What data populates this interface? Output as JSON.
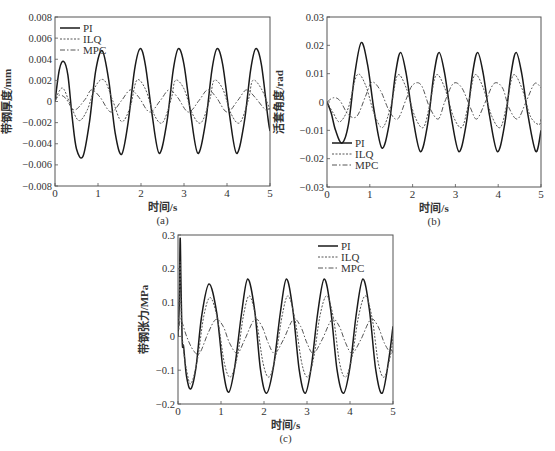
{
  "chart_data": [
    {
      "id": "a",
      "type": "line",
      "caption": "(a)",
      "xlabel": "时间/s",
      "ylabel": "带钢厚度/mm",
      "xlim": [
        0,
        5
      ],
      "ylim": [
        -0.008,
        0.008
      ],
      "xticks": [
        0,
        1,
        2,
        3,
        4,
        5
      ],
      "xtick_labels": [
        "0",
        "1",
        "2",
        "3",
        "4",
        "5"
      ],
      "yticks": [
        -0.008,
        -0.006,
        -0.004,
        -0.002,
        0,
        0.002,
        0.004,
        0.006,
        0.008
      ],
      "ytick_labels": [
        "-0.008",
        "-0.006",
        "-0.004",
        "-0.002",
        "0",
        "0.002",
        "0.004",
        "0.006",
        "0.008"
      ],
      "grid": false,
      "legend_position": "upper left",
      "series": [
        {
          "name": "PI",
          "style": "solid",
          "x": [
            0,
            0.1,
            0.2,
            0.3,
            0.4,
            0.5,
            0.65,
            0.8,
            0.95,
            1.1,
            1.25,
            1.4,
            1.55,
            1.7,
            1.85,
            1.98,
            2.1,
            2.25,
            2.42,
            2.6,
            2.75,
            2.87,
            3.0,
            3.15,
            3.32,
            3.5,
            3.65,
            3.77,
            3.9,
            4.05,
            4.22,
            4.4,
            4.55,
            4.67,
            4.8,
            4.95,
            5.0
          ],
          "values": [
            0,
            0.003,
            0.0038,
            0.0025,
            -0.0015,
            -0.0045,
            -0.0052,
            -0.002,
            0.003,
            0.0048,
            0.002,
            -0.003,
            -0.005,
            -0.002,
            0.003,
            0.005,
            0.0035,
            -0.001,
            -0.0049,
            -0.002,
            0.003,
            0.005,
            0.0035,
            -0.001,
            -0.0049,
            -0.002,
            0.003,
            0.005,
            0.0035,
            -0.001,
            -0.0049,
            -0.002,
            0.003,
            0.005,
            0.0035,
            -0.0015,
            -0.0028
          ]
        },
        {
          "name": "ILQ",
          "style": "dotted",
          "x": [
            0,
            0.1,
            0.2,
            0.35,
            0.55,
            0.75,
            0.95,
            1.15,
            1.35,
            1.55,
            1.75,
            1.9,
            2.1,
            2.3,
            2.5,
            2.7,
            2.8,
            3.0,
            3.2,
            3.4,
            3.6,
            3.7,
            3.9,
            4.1,
            4.3,
            4.5,
            4.6,
            4.8,
            5.0
          ],
          "values": [
            0,
            0.001,
            0.0012,
            -0.0002,
            -0.0018,
            -0.0008,
            0.0015,
            0.002,
            0,
            -0.0019,
            -0.0005,
            0.002,
            0.0012,
            -0.0012,
            -0.002,
            0.0002,
            0.002,
            0.0012,
            -0.0012,
            -0.002,
            0.0002,
            0.002,
            0.0012,
            -0.0012,
            -0.002,
            0.0002,
            0.002,
            0.0012,
            -0.0008
          ]
        },
        {
          "name": "MPC",
          "style": "dashdot",
          "x": [
            0,
            0.1,
            0.25,
            0.45,
            0.7,
            0.85,
            1.05,
            1.3,
            1.55,
            1.75,
            1.95,
            2.2,
            2.45,
            2.65,
            2.85,
            3.1,
            3.35,
            3.55,
            3.75,
            4.0,
            4.25,
            4.45,
            4.65,
            4.9,
            5.0
          ],
          "values": [
            0,
            0.0006,
            0.0003,
            -0.0008,
            0.0002,
            0.0011,
            0.0004,
            -0.001,
            0.0001,
            0.0011,
            0.0004,
            -0.001,
            0.0001,
            0.0011,
            0.0004,
            -0.001,
            0.0001,
            0.0011,
            0.0004,
            -0.001,
            0.0001,
            0.0011,
            0.0004,
            -0.0008,
            -0.0005
          ]
        }
      ]
    },
    {
      "id": "b",
      "type": "line",
      "caption": "(b)",
      "xlabel": "时间/s",
      "ylabel": "活套角度/rad",
      "xlim": [
        0,
        5
      ],
      "ylim": [
        -0.03,
        0.03
      ],
      "xticks": [
        0,
        1,
        2,
        3,
        4,
        5
      ],
      "xtick_labels": [
        "0",
        "1",
        "2",
        "3",
        "4",
        "5"
      ],
      "yticks": [
        -0.03,
        -0.02,
        -0.01,
        0,
        0.01,
        0.02,
        0.03
      ],
      "ytick_labels": [
        "-0.03",
        "-0.02",
        "-0.01",
        "0",
        "0.01",
        "0.02",
        "0.03"
      ],
      "grid": false,
      "legend_position": "lower left",
      "series": [
        {
          "name": "PI",
          "style": "solid",
          "x": [
            0,
            0.1,
            0.2,
            0.35,
            0.5,
            0.65,
            0.8,
            0.95,
            1.1,
            1.28,
            1.45,
            1.6,
            1.72,
            1.85,
            2.0,
            2.18,
            2.35,
            2.5,
            2.62,
            2.75,
            2.9,
            3.08,
            3.25,
            3.4,
            3.52,
            3.65,
            3.8,
            3.98,
            4.15,
            4.3,
            4.42,
            4.55,
            4.7,
            4.88,
            5.0
          ],
          "values": [
            0,
            -0.004,
            -0.01,
            -0.0145,
            -0.008,
            0.01,
            0.021,
            0.013,
            -0.003,
            -0.0162,
            -0.008,
            0.01,
            0.0175,
            0.01,
            -0.005,
            -0.0175,
            -0.008,
            0.01,
            0.0175,
            0.01,
            -0.005,
            -0.0175,
            -0.008,
            0.01,
            0.0175,
            0.01,
            -0.005,
            -0.0175,
            -0.008,
            0.01,
            0.0175,
            0.01,
            -0.005,
            -0.0175,
            -0.01
          ]
        },
        {
          "name": "ILQ",
          "style": "dotted",
          "x": [
            0,
            0.15,
            0.3,
            0.5,
            0.7,
            0.9,
            1.1,
            1.3,
            1.5,
            1.65,
            1.85,
            2.05,
            2.25,
            2.4,
            2.55,
            2.75,
            2.95,
            3.15,
            3.3,
            3.45,
            3.65,
            3.85,
            4.05,
            4.2,
            4.35,
            4.55,
            4.75,
            4.95,
            5.0
          ],
          "values": [
            0,
            -0.004,
            -0.007,
            -0.002,
            0.0095,
            0.006,
            -0.004,
            -0.009,
            -0.001,
            0.0095,
            0.005,
            -0.005,
            -0.009,
            -0.001,
            0.0095,
            0.005,
            -0.005,
            -0.009,
            -0.001,
            0.0095,
            0.005,
            -0.005,
            -0.009,
            -0.001,
            0.0095,
            0.005,
            -0.005,
            -0.008,
            -0.006
          ]
        },
        {
          "name": "MPC",
          "style": "dashdot",
          "x": [
            0,
            0.15,
            0.3,
            0.5,
            0.7,
            0.9,
            1.05,
            1.25,
            1.45,
            1.65,
            1.85,
            2.0,
            2.2,
            2.4,
            2.6,
            2.75,
            2.95,
            3.15,
            3.35,
            3.5,
            3.7,
            3.9,
            4.1,
            4.25,
            4.45,
            4.65,
            4.85,
            5.0
          ],
          "values": [
            0,
            0.0015,
            0.0005,
            -0.0045,
            -0.005,
            0.002,
            0.007,
            0.004,
            -0.003,
            -0.006,
            0.001,
            0.006,
            0.006,
            -0.002,
            -0.006,
            0,
            0.0065,
            0.005,
            -0.002,
            -0.006,
            0,
            0.0065,
            0.005,
            -0.002,
            -0.006,
            0,
            0.0065,
            0.005
          ]
        }
      ]
    },
    {
      "id": "c",
      "type": "line",
      "caption": "(c)",
      "xlabel": "时间/s",
      "ylabel": "带钢张力/MPa",
      "xlim": [
        0,
        5
      ],
      "ylim": [
        -0.2,
        0.3
      ],
      "xticks": [
        0,
        1,
        2,
        3,
        4,
        5
      ],
      "xtick_labels": [
        "0",
        "1",
        "2",
        "3",
        "4",
        "5"
      ],
      "yticks": [
        -0.2,
        -0.1,
        0,
        0.1,
        0.2,
        0.3
      ],
      "ytick_labels": [
        "-0.2",
        "-0.1",
        "0",
        "0.1",
        "0.2",
        "0.3"
      ],
      "grid": false,
      "legend_position": "upper right",
      "series": [
        {
          "name": "PI",
          "style": "solid",
          "x": [
            0,
            0.03,
            0.05,
            0.07,
            0.1,
            0.13,
            0.2,
            0.3,
            0.42,
            0.55,
            0.72,
            0.9,
            1.05,
            1.18,
            1.32,
            1.48,
            1.62,
            1.78,
            1.92,
            2.06,
            2.22,
            2.38,
            2.52,
            2.67,
            2.82,
            2.96,
            3.1,
            3.25,
            3.4,
            3.55,
            3.7,
            3.85,
            4.0,
            4.15,
            4.3,
            4.45,
            4.6,
            4.75,
            4.9,
            5.0
          ],
          "values": [
            0,
            0.1,
            0.29,
            0.15,
            -0.02,
            -0.03,
            -0.12,
            -0.155,
            -0.09,
            0.06,
            0.155,
            0.07,
            -0.1,
            -0.165,
            -0.09,
            0.07,
            0.17,
            0.08,
            -0.1,
            -0.168,
            -0.09,
            0.07,
            0.17,
            0.08,
            -0.1,
            -0.168,
            -0.09,
            0.07,
            0.17,
            0.08,
            -0.1,
            -0.168,
            -0.09,
            0.07,
            0.17,
            0.08,
            -0.1,
            -0.168,
            -0.07,
            0.03
          ]
        },
        {
          "name": "ILQ",
          "style": "dotted",
          "x": [
            0,
            0.03,
            0.05,
            0.08,
            0.12,
            0.2,
            0.3,
            0.45,
            0.6,
            0.75,
            0.92,
            1.08,
            1.22,
            1.38,
            1.52,
            1.66,
            1.82,
            1.98,
            2.12,
            2.27,
            2.42,
            2.56,
            2.72,
            2.88,
            3.02,
            3.16,
            3.3,
            3.46,
            3.62,
            3.76,
            3.9,
            4.05,
            4.2,
            4.36,
            4.52,
            4.66,
            4.8,
            4.95,
            5.0
          ],
          "values": [
            0,
            0.12,
            0.22,
            0.05,
            -0.03,
            -0.1,
            -0.14,
            -0.07,
            0.06,
            0.115,
            0.05,
            -0.08,
            -0.12,
            -0.06,
            0.06,
            0.12,
            0.05,
            -0.08,
            -0.12,
            -0.06,
            0.06,
            0.12,
            0.05,
            -0.08,
            -0.12,
            -0.06,
            0.06,
            0.12,
            0.05,
            -0.08,
            -0.12,
            -0.06,
            0.06,
            0.12,
            0.05,
            -0.08,
            -0.12,
            -0.05,
            0
          ]
        },
        {
          "name": "MPC",
          "style": "dashdot",
          "x": [
            0,
            0.05,
            0.1,
            0.2,
            0.35,
            0.5,
            0.7,
            0.88,
            1.05,
            1.2,
            1.38,
            1.55,
            1.78,
            1.95,
            2.1,
            2.25,
            2.45,
            2.68,
            2.85,
            3.0,
            3.15,
            3.35,
            3.58,
            3.75,
            3.9,
            4.05,
            4.25,
            4.48,
            4.65,
            4.8,
            4.95,
            5.0
          ],
          "values": [
            0,
            0.05,
            0.04,
            0,
            -0.04,
            -0.05,
            0.01,
            0.05,
            0.03,
            -0.02,
            -0.05,
            -0.01,
            0.05,
            0.03,
            -0.02,
            -0.05,
            -0.01,
            0.05,
            0.03,
            -0.02,
            -0.05,
            -0.01,
            0.05,
            0.03,
            -0.02,
            -0.05,
            -0.01,
            0.05,
            0.03,
            -0.02,
            -0.05,
            -0.04
          ]
        }
      ]
    }
  ],
  "panels": {
    "a": {
      "left": 55,
      "top": 17,
      "width": 215,
      "height": 169,
      "legend": {
        "x": 5,
        "y": 5
      }
    },
    "b": {
      "left": 327,
      "top": 17,
      "width": 214,
      "height": 170,
      "legend": {
        "x": 5,
        "y": 120
      }
    },
    "c": {
      "left": 178,
      "top": 235,
      "width": 215,
      "height": 169,
      "legend": {
        "x": 140,
        "y": 5
      }
    }
  },
  "colors": {
    "axis": "#555555",
    "line": "#222222",
    "text": "#333333"
  }
}
